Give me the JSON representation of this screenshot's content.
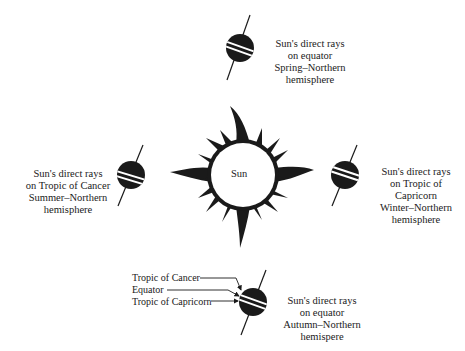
{
  "diagram": {
    "type": "seasons-earth-orbit",
    "sun": {
      "label": "Sun",
      "cx": 243,
      "cy": 175,
      "r": 33
    },
    "globes": [
      {
        "id": "spring",
        "position": "top",
        "cx": 240,
        "cy": 48,
        "r": 14,
        "axis": [
          250,
          15,
          227,
          80
        ],
        "caption": [
          "Sun's direct rays",
          "on equator",
          "Spring–Northern",
          "hemisphere"
        ]
      },
      {
        "id": "summer",
        "position": "left",
        "cx": 131,
        "cy": 175,
        "r": 14,
        "axis": [
          143,
          145,
          118,
          206
        ],
        "caption": [
          "Sun's direct rays",
          "on Tropic of Cancer",
          "Summer–Northern",
          "hemisphere"
        ]
      },
      {
        "id": "winter",
        "position": "right",
        "cx": 345,
        "cy": 175,
        "r": 14,
        "axis": [
          357,
          145,
          332,
          206
        ],
        "caption": [
          "Sun's direct rays",
          "on Tropic of",
          "Capricorn",
          "Winter–Northern",
          "hemisphere"
        ]
      },
      {
        "id": "autumn",
        "position": "bottom",
        "cx": 253,
        "cy": 302,
        "r": 14,
        "axis": [
          266,
          270,
          241,
          335
        ],
        "caption": [
          "Sun's direct rays",
          "on equator",
          "Autumn–Northern",
          "hemispere"
        ]
      }
    ],
    "latitude_labels": [
      {
        "text": "Tropic of Cancer",
        "name": "tropic-of-cancer-label"
      },
      {
        "text": "Equator",
        "name": "equator-label"
      },
      {
        "text": "Tropic of Capricorn",
        "name": "tropic-of-capricorn-label"
      }
    ],
    "colors": {
      "globe_fill": "#1a1a1a",
      "band": "#ffffff",
      "ink": "#1a1a1a",
      "background": "#ffffff"
    }
  }
}
